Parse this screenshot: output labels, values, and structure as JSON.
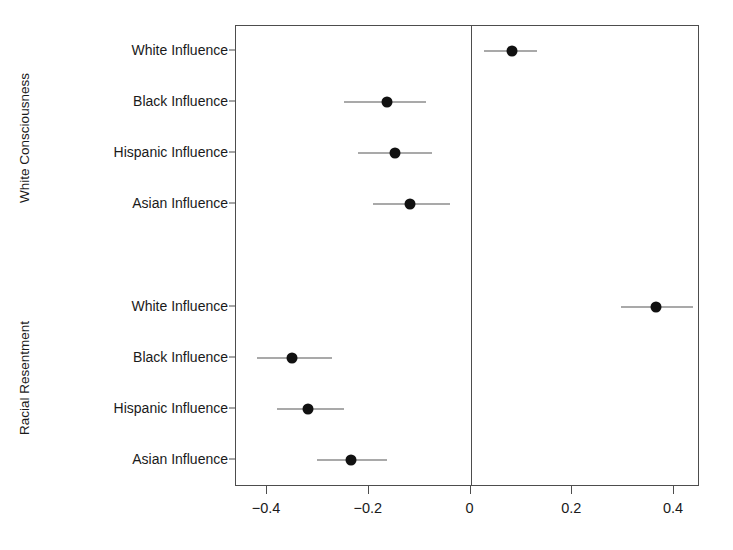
{
  "chart_data": {
    "type": "scatter",
    "title": "",
    "xlabel": "",
    "ylabel": "",
    "xlim": [
      -0.49,
      0.45
    ],
    "grid": false,
    "legend": "none",
    "orientation": "horizontal",
    "marker": "filled-circle",
    "error_bars": "horizontal confidence intervals",
    "axis": {
      "x_ticks": [
        -0.4,
        -0.2,
        0,
        0.2,
        0.4
      ],
      "x_tick_labels": [
        "−0.4",
        "−0.2",
        "0",
        "0.2",
        "0.4"
      ],
      "zero_reference_line": 0
    },
    "colors": {
      "point": "#111111",
      "interval": "#545454",
      "axis": "#4d4d4d",
      "text": "#1a1a1a",
      "background": "#ffffff"
    },
    "groups": [
      {
        "name": "White Consciousness",
        "categories": [
          "White Influence",
          "Black Influence",
          "Hispanic Influence",
          "Asian Influence"
        ],
        "estimates": [
          0.082,
          -0.165,
          -0.149,
          -0.118
        ],
        "ci_low": [
          0.026,
          -0.248,
          -0.222,
          -0.191
        ],
        "ci_high": [
          0.13,
          -0.087,
          -0.075,
          -0.041
        ]
      },
      {
        "name": "Racial Resentment",
        "categories": [
          "White Influence",
          "Black Influence",
          "Hispanic Influence",
          "Asian Influence"
        ],
        "estimates": [
          0.364,
          -0.35,
          -0.32,
          -0.234
        ],
        "ci_low": [
          0.295,
          -0.419,
          -0.381,
          -0.301
        ],
        "ci_high": [
          0.437,
          -0.273,
          -0.249,
          -0.165
        ]
      }
    ]
  }
}
